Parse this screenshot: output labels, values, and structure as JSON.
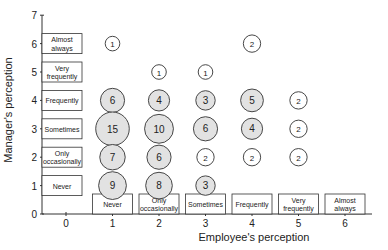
{
  "chart_data": {
    "type": "scatter",
    "subtype": "bubble",
    "title": "",
    "xlabel": "Employee's perception",
    "ylabel": "Manager's perception",
    "xlim": [
      0,
      6
    ],
    "ylim": [
      0,
      7
    ],
    "x_ticks": [
      "0",
      "1",
      "2",
      "3",
      "4",
      "5",
      "6"
    ],
    "y_ticks": [
      "0",
      "1",
      "2",
      "3",
      "4",
      "5",
      "6",
      "7"
    ],
    "x_category_boxes": [
      {
        "x": 1,
        "label": "Never"
      },
      {
        "x": 2,
        "label": "Only occasionally"
      },
      {
        "x": 3,
        "label": "Sometimes"
      },
      {
        "x": 4,
        "label": "Frequently"
      },
      {
        "x": 5,
        "label": "Very frequently"
      },
      {
        "x": 6,
        "label": "Almost always"
      }
    ],
    "y_category_boxes": [
      {
        "y": 1,
        "label": "Never"
      },
      {
        "y": 2,
        "label": "Only occasionally"
      },
      {
        "y": 3,
        "label": "Sometimes"
      },
      {
        "y": 4,
        "label": "Frequently"
      },
      {
        "y": 5,
        "label": "Very frequently"
      },
      {
        "y": 6,
        "label": "Almost always"
      }
    ],
    "points": [
      {
        "x": 1,
        "y": 6,
        "count": 1
      },
      {
        "x": 1,
        "y": 4,
        "count": 6
      },
      {
        "x": 1,
        "y": 3,
        "count": 15
      },
      {
        "x": 1,
        "y": 2,
        "count": 7
      },
      {
        "x": 1,
        "y": 1,
        "count": 9
      },
      {
        "x": 2,
        "y": 5,
        "count": 1
      },
      {
        "x": 2,
        "y": 4,
        "count": 4
      },
      {
        "x": 2,
        "y": 3,
        "count": 10
      },
      {
        "x": 2,
        "y": 2,
        "count": 6
      },
      {
        "x": 2,
        "y": 1,
        "count": 8
      },
      {
        "x": 3,
        "y": 5,
        "count": 1
      },
      {
        "x": 3,
        "y": 4,
        "count": 3
      },
      {
        "x": 3,
        "y": 3,
        "count": 6
      },
      {
        "x": 3,
        "y": 2,
        "count": 2
      },
      {
        "x": 3,
        "y": 1,
        "count": 3
      },
      {
        "x": 4,
        "y": 6,
        "count": 2
      },
      {
        "x": 4,
        "y": 4,
        "count": 5
      },
      {
        "x": 4,
        "y": 3,
        "count": 4
      },
      {
        "x": 4,
        "y": 2,
        "count": 2
      },
      {
        "x": 5,
        "y": 4,
        "count": 2
      },
      {
        "x": 5,
        "y": 3,
        "count": 2
      },
      {
        "x": 5,
        "y": 2,
        "count": 2
      }
    ],
    "grid": false,
    "legend": null
  },
  "colors": {
    "bubble_fill": "#e2e2e2",
    "bubble_stroke": "#333333",
    "axis": "#333333",
    "box_fill": "#ffffff"
  }
}
